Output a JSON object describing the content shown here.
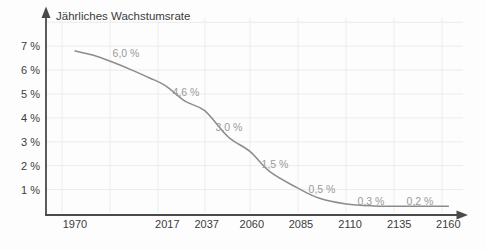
{
  "chart_data": {
    "type": "line",
    "title": "Jährliches Wachstumsrate",
    "x_ticks": [
      1970,
      2017,
      2037,
      2060,
      2085,
      2110,
      2135,
      2160
    ],
    "y_ticks": [
      7,
      6,
      5,
      4,
      3,
      2,
      1
    ],
    "y_tick_suffix": " %",
    "xlim": [
      1970,
      2160
    ],
    "ylim": [
      0,
      8
    ],
    "grid": true,
    "legend": false,
    "series": [
      {
        "name": "Jährliches Wachstumsrate",
        "points": [
          [
            1970,
            6.8
          ],
          [
            1979,
            6.63
          ],
          [
            1989,
            6.34
          ],
          [
            1999,
            6.0
          ],
          [
            2008,
            5.67
          ],
          [
            2016,
            5.35
          ],
          [
            2026,
            4.7
          ],
          [
            2036,
            4.3
          ],
          [
            2048,
            3.2
          ],
          [
            2059,
            2.6
          ],
          [
            2069,
            1.76
          ],
          [
            2083,
            1.08
          ],
          [
            2094,
            0.65
          ],
          [
            2108,
            0.4
          ],
          [
            2122,
            0.32
          ],
          [
            2140,
            0.3
          ],
          [
            2160,
            0.3
          ]
        ]
      }
    ],
    "annotations": [
      {
        "text": "6,0 %",
        "x": 126,
        "y": 53
      },
      {
        "text": "4,6 %",
        "x": 186,
        "y": 92
      },
      {
        "text": "3,0 %",
        "x": 229,
        "y": 127
      },
      {
        "text": "1,5 %",
        "x": 275,
        "y": 164
      },
      {
        "text": "0,5 %",
        "x": 322,
        "y": 189
      },
      {
        "text": "0,3 %",
        "x": 371,
        "y": 201
      },
      {
        "text": "0,2 %",
        "x": 420,
        "y": 201
      },
      {
        "text": "6,0 %",
        "x": 126,
        "y": 53
      }
    ],
    "grid_x_px": [
      62,
      110,
      158,
      205,
      250,
      298,
      346,
      394,
      442
    ],
    "colors": {
      "axis": "#4a4a4a",
      "tick_text": "#3c3c3c",
      "curve": "#8c8c8c",
      "annotation": "#9a9a9a",
      "grid": "#ececec",
      "background": "#fdfdfd"
    }
  }
}
